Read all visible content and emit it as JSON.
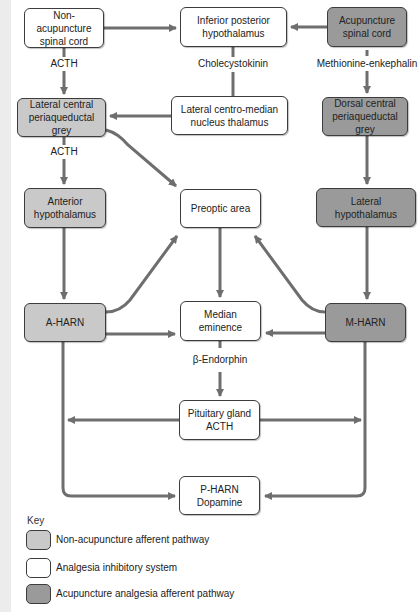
{
  "diagram": {
    "nodes": {
      "non_acu_spinal": {
        "line1": "Non-acupuncture",
        "line2": "spinal cord",
        "category": "analgesia_inhibitory"
      },
      "inf_post_hypo": {
        "line1": "Inferior posterior",
        "line2": "hypothalamus",
        "category": "analgesia_inhibitory"
      },
      "acu_spinal": {
        "line1": "Acupuncture",
        "line2": "spinal cord",
        "category": "acupuncture_afferent"
      },
      "lat_central_pag": {
        "line1": "Lateral central",
        "line2": "periaqueductal grey",
        "category": "non_acupuncture_afferent"
      },
      "lat_cm_thalamus": {
        "line1": "Lateral centro-median",
        "line2": "nucleus thalamus",
        "category": "analgesia_inhibitory"
      },
      "dorsal_central_pag": {
        "line1": "Dorsal central",
        "line2": "periaqueductal grey",
        "category": "acupuncture_afferent"
      },
      "ant_hypo": {
        "line1": "Anterior",
        "line2": "hypothalamus",
        "category": "non_acupuncture_afferent"
      },
      "preoptic": {
        "line1": "Preoptic area",
        "category": "analgesia_inhibitory"
      },
      "lat_hypo": {
        "line1": "Lateral hypothalamus",
        "category": "acupuncture_afferent"
      },
      "a_harn": {
        "line1": "A-HARN",
        "category": "non_acupuncture_afferent"
      },
      "median_em": {
        "line1": "Median eminence",
        "category": "analgesia_inhibitory"
      },
      "m_harn": {
        "line1": "M-HARN",
        "category": "acupuncture_afferent"
      },
      "pituitary": {
        "line1": "Pituitary gland",
        "line2": "ACTH",
        "category": "analgesia_inhibitory"
      },
      "p_harn": {
        "line1": "P-HARN",
        "line2": "Dopamine",
        "category": "analgesia_inhibitory"
      }
    },
    "edge_labels": {
      "acth_1": "ACTH",
      "acth_2": "ACTH",
      "cholecystokinin": "Cholecystokinin",
      "met_enk": "Methionine-enkephalin",
      "beta_endorphin": "β-Endorphin"
    },
    "edges": [
      {
        "from": "non_acu_spinal",
        "to": "inf_post_hypo"
      },
      {
        "from": "acu_spinal",
        "to": "inf_post_hypo"
      },
      {
        "from": "non_acu_spinal",
        "to": "lat_central_pag",
        "label": "ACTH"
      },
      {
        "from": "inf_post_hypo",
        "to": "lat_cm_thalamus",
        "label": "Cholecystokinin"
      },
      {
        "from": "acu_spinal",
        "to": "dorsal_central_pag",
        "label": "Methionine-enkephalin"
      },
      {
        "from": "lat_cm_thalamus",
        "to": "lat_central_pag"
      },
      {
        "from": "lat_central_pag",
        "to": "ant_hypo",
        "label": "ACTH"
      },
      {
        "from": "lat_central_pag",
        "to": "preoptic"
      },
      {
        "from": "dorsal_central_pag",
        "to": "lat_hypo"
      },
      {
        "from": "ant_hypo",
        "to": "a_harn"
      },
      {
        "from": "preoptic",
        "to": "median_em"
      },
      {
        "from": "lat_hypo",
        "to": "m_harn"
      },
      {
        "from": "a_harn",
        "to": "preoptic"
      },
      {
        "from": "m_harn",
        "to": "preoptic"
      },
      {
        "from": "a_harn",
        "to": "median_em"
      },
      {
        "from": "m_harn",
        "to": "median_em"
      },
      {
        "from": "median_em",
        "to": "pituitary",
        "label": "β-Endorphin"
      },
      {
        "from": "pituitary",
        "to": "a_harn"
      },
      {
        "from": "pituitary",
        "to": "m_harn"
      },
      {
        "from": "a_harn",
        "to": "p_harn"
      },
      {
        "from": "m_harn",
        "to": "p_harn"
      }
    ]
  },
  "key": {
    "title": "Key",
    "items": [
      {
        "label": "Non-acupuncture afferent pathway",
        "color": "#c9c9c9"
      },
      {
        "label": "Analgesia inhibitory system",
        "color": "#ffffff"
      },
      {
        "label": "Acupuncture analgesia afferent pathway",
        "color": "#9a9a9a"
      }
    ]
  },
  "colors": {
    "line": "#6e6e6e",
    "border": "#3c3c3c",
    "light_fill": "#c9c9c9",
    "dark_fill": "#9a9a9a"
  }
}
